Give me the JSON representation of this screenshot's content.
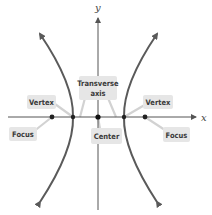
{
  "diagram": {
    "axes": {
      "x_label": "x",
      "y_label": "y"
    },
    "labels": {
      "vertex_left": "Vertex",
      "vertex_right": "Vertex",
      "focus_left": "Focus",
      "focus_right": "Focus",
      "transverse_line1": "Transverse",
      "transverse_line2": "axis",
      "center": "Center"
    },
    "colors": {
      "curve": "#5a5a5a",
      "axis": "#555555",
      "label_box": "#e6e6e6",
      "leader": "#d4d4d4",
      "point": "#222222"
    }
  }
}
